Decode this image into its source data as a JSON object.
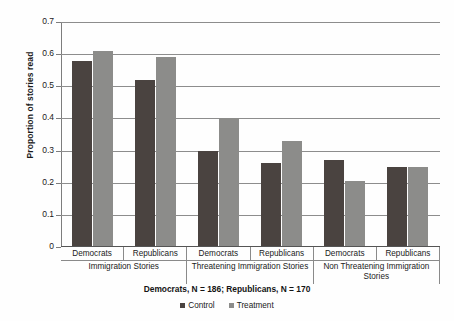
{
  "chart_data": {
    "type": "bar",
    "title": "",
    "xlabel": "",
    "ylabel": "Proportion of stories read",
    "ylim": [
      0,
      0.7
    ],
    "ytick_labels": [
      "0.7",
      "0.6",
      "0.5",
      "0.4",
      "0.3",
      "0.2",
      "0.1",
      "0"
    ],
    "ytick_values": [
      0.7,
      0.6,
      0.5,
      0.4,
      0.3,
      0.2,
      0.1,
      0
    ],
    "grid": true,
    "legend_position": "bottom",
    "categories": [
      "Democrats / Immigration Stories",
      "Republicans / Immigration Stories",
      "Democrats / Threatening Immigration Stories",
      "Republicans / Threatening Immigration Stories",
      "Democrats / Non Threatening Immigration Stories",
      "Republicans / Non Threatening Immigration Stories"
    ],
    "series": [
      {
        "name": "Control",
        "color": "#4a4340",
        "values": [
          0.58,
          0.52,
          0.3,
          0.26,
          0.27,
          0.25
        ]
      },
      {
        "name": "Treatment",
        "color": "#8c8c8a",
        "values": [
          0.61,
          0.59,
          0.4,
          0.33,
          0.205,
          0.25
        ]
      }
    ],
    "annotation": "Democrats, N = 186; Republicans, N = 170"
  },
  "axis": {
    "y_title": "Proportion of stories read",
    "ticks": [
      {
        "label": "0.7"
      },
      {
        "label": "0.6"
      },
      {
        "label": "0.5"
      },
      {
        "label": "0.4"
      },
      {
        "label": "0.3"
      },
      {
        "label": "0.2"
      },
      {
        "label": "0.1"
      },
      {
        "label": "0"
      }
    ]
  },
  "groups": [
    {
      "supergroup": "Immigration Stories",
      "cells": [
        {
          "label": "Democrats"
        },
        {
          "label": "Republicans"
        }
      ]
    },
    {
      "supergroup": "Threatening Immigration Stories",
      "cells": [
        {
          "label": "Democrats"
        },
        {
          "label": "Republicans"
        }
      ]
    },
    {
      "supergroup": "Non Threatening Immigration Stories",
      "cells": [
        {
          "label": "Democrats"
        },
        {
          "label": "Republicans"
        }
      ]
    }
  ],
  "caption": "Democrats, N = 186; Republicans, N = 170",
  "legend": {
    "items": [
      {
        "label": "Control"
      },
      {
        "label": "Treatment"
      }
    ]
  }
}
